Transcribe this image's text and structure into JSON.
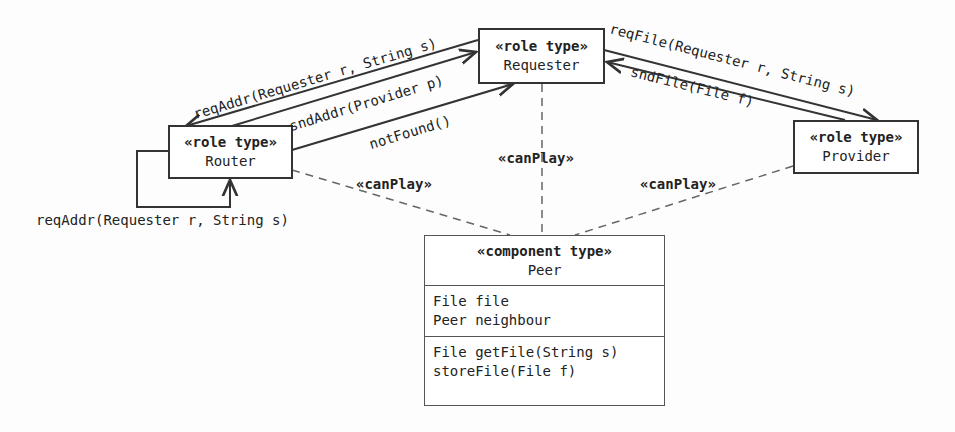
{
  "roles": {
    "requester": {
      "stereotype": "«role type»",
      "name": "Requester"
    },
    "router": {
      "stereotype": "«role type»",
      "name": "Router"
    },
    "provider": {
      "stereotype": "«role type»",
      "name": "Provider"
    }
  },
  "component": {
    "stereotype": "«component type»",
    "name": "Peer",
    "attributes": [
      "File file",
      "Peer neighbour"
    ],
    "operations": [
      "File getFile(String s)",
      "storeFile(File f)"
    ]
  },
  "messages": {
    "req_addr_top": "reqAddr(Requester r, String s)",
    "snd_addr": "sndAddr(Provider p)",
    "not_found": "notFound()",
    "req_addr_self": "reqAddr(Requester r, String s)",
    "req_file": "reqFile(Requester r, String s)",
    "snd_file": "sndFile(File f)"
  },
  "relations": {
    "can_play_router": "«canPlay»",
    "can_play_requester": "«canPlay»",
    "can_play_provider": "«canPlay»"
  }
}
